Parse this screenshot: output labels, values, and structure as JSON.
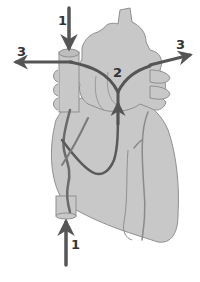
{
  "diagram": {
    "colors": {
      "heart_fill": "#c8c8c8",
      "heart_outline": "#8f8f8f",
      "vessel_path": "#5a5a5a",
      "arrow": "#555555",
      "label": "#333333"
    },
    "labels": [
      {
        "id": "label-1-top",
        "text": "1",
        "x": 58,
        "y": 14
      },
      {
        "id": "label-3-left",
        "text": "3",
        "x": 17,
        "y": 45
      },
      {
        "id": "label-2",
        "text": "2",
        "x": 113,
        "y": 66
      },
      {
        "id": "label-3-right",
        "text": "3",
        "x": 176,
        "y": 38
      },
      {
        "id": "label-1-bottom",
        "text": "1",
        "x": 71,
        "y": 238
      }
    ],
    "arrows": [
      {
        "id": "arrow-1-top",
        "direction": "down",
        "from": [
          69,
          8
        ],
        "to": [
          69,
          50
        ]
      },
      {
        "id": "arrow-3-left",
        "direction": "left",
        "from": [
          70,
          62
        ],
        "to": [
          14,
          62
        ]
      },
      {
        "id": "arrow-3-right",
        "direction": "right",
        "from": [
          150,
          65
        ],
        "to": [
          192,
          55
        ]
      },
      {
        "id": "arrow-2-up",
        "direction": "up",
        "from": [
          118,
          120
        ],
        "to": [
          118,
          104
        ]
      },
      {
        "id": "arrow-1-bottom",
        "direction": "up",
        "from": [
          66,
          265
        ],
        "to": [
          66,
          216
        ]
      }
    ]
  }
}
